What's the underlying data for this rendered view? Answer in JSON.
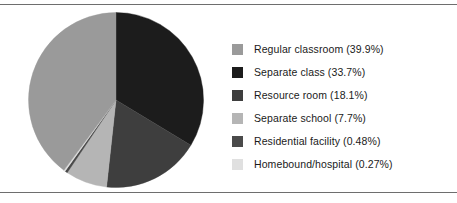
{
  "figure": {
    "background": "#ffffff",
    "rule_color": "#6e6e6e"
  },
  "legend": {
    "position": "right",
    "items": [
      {
        "label": "Regular classroom (39.9%)",
        "swatch_name": "legend-swatch-regular-classroom",
        "color": "#9a9a9a"
      },
      {
        "label": "Separate class (33.7%)",
        "swatch_name": "legend-swatch-separate-class",
        "color": "#1c1c1c"
      },
      {
        "label": "Resource room (18.1%)",
        "swatch_name": "legend-swatch-resource-room",
        "color": "#3e3e3e"
      },
      {
        "label": "Separate school (7.7%)",
        "swatch_name": "legend-swatch-separate-school",
        "color": "#b5b5b5"
      },
      {
        "label": "Residential facility (0.48%)",
        "swatch_name": "legend-swatch-residential-facility",
        "color": "#4a4a4a"
      },
      {
        "label": "Homebound/hospital (0.27%)",
        "swatch_name": "legend-swatch-homebound-hospital",
        "color": "#e0e0e0"
      }
    ]
  },
  "chart_data": {
    "type": "pie",
    "title": "",
    "xlabel": "",
    "ylabel": "",
    "legend_position": "right",
    "grid": false,
    "start_angle_deg": 0,
    "direction": "clockwise",
    "units": "percent",
    "categories": [
      "Regular classroom",
      "Separate class",
      "Resource room",
      "Separate school",
      "Residential facility",
      "Homebound/hospital"
    ],
    "values": [
      39.9,
      33.7,
      18.1,
      7.7,
      0.48,
      0.27
    ],
    "labels": [
      "Regular classroom (39.9%)",
      "Separate class (33.7%)",
      "Resource room (18.1%)",
      "Separate school (7.7%)",
      "Residential facility (0.48%)",
      "Homebound/hospital (0.27%)"
    ],
    "colors": [
      "#9a9a9a",
      "#1c1c1c",
      "#3e3e3e",
      "#b5b5b5",
      "#4a4a4a",
      "#e0e0e0"
    ],
    "slice_order_clockwise_from_top": [
      "Separate class",
      "Resource room",
      "Separate school",
      "Residential facility",
      "Homebound/hospital",
      "Regular classroom"
    ]
  }
}
